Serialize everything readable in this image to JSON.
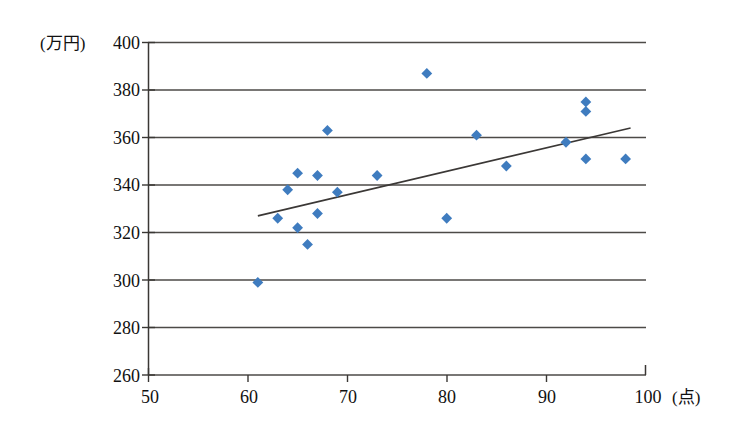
{
  "chart_data": {
    "type": "scatter",
    "title": "",
    "xlabel": "(点)",
    "ylabel": "(万円)",
    "xlim": [
      50,
      100
    ],
    "ylim": [
      260,
      400
    ],
    "xticks": [
      50,
      60,
      70,
      80,
      90,
      100
    ],
    "yticks": [
      260,
      280,
      300,
      320,
      340,
      360,
      380,
      400
    ],
    "grid": true,
    "legend": false,
    "marker": "diamond",
    "marker_color": "#3f7cbf",
    "points": [
      {
        "x": 61,
        "y": 299
      },
      {
        "x": 63,
        "y": 326
      },
      {
        "x": 64,
        "y": 338
      },
      {
        "x": 65,
        "y": 345
      },
      {
        "x": 65,
        "y": 322
      },
      {
        "x": 66,
        "y": 315
      },
      {
        "x": 67,
        "y": 344
      },
      {
        "x": 67,
        "y": 328
      },
      {
        "x": 68,
        "y": 363
      },
      {
        "x": 69,
        "y": 337
      },
      {
        "x": 73,
        "y": 344
      },
      {
        "x": 78,
        "y": 387
      },
      {
        "x": 80,
        "y": 326
      },
      {
        "x": 83,
        "y": 361
      },
      {
        "x": 86,
        "y": 348
      },
      {
        "x": 92,
        "y": 358
      },
      {
        "x": 94,
        "y": 375
      },
      {
        "x": 94,
        "y": 371
      },
      {
        "x": 94,
        "y": 351
      },
      {
        "x": 98,
        "y": 351
      }
    ],
    "trend_line": {
      "type": "linear",
      "x_start": 61,
      "y_start": 327,
      "x_end": 98.5,
      "y_end": 364
    }
  },
  "axis": {
    "y_unit": "(万円)",
    "x_unit": "(点)",
    "y_tick_labels": [
      "400",
      "380",
      "360",
      "340",
      "320",
      "300",
      "280",
      "260"
    ],
    "x_tick_labels": [
      "50",
      "60",
      "70",
      "80",
      "90",
      "100"
    ]
  }
}
